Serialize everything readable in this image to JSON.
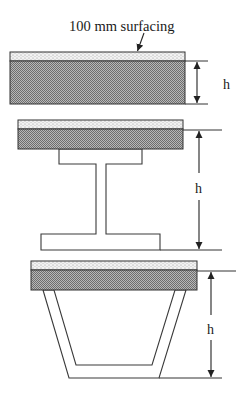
{
  "annotation": {
    "text": "100 mm surfacing",
    "arrow_from": [
      144,
      33
    ],
    "arrow_to": [
      137,
      52
    ]
  },
  "colors": {
    "line": "#333333",
    "surfacing_fill": "#f2f2f2",
    "surfacing_dot": "#9a9a9a",
    "deck_fill": "#b0b0b0",
    "deck_check": "#6e6e6e",
    "background": "#ffffff"
  },
  "sections": [
    {
      "id": "solid-slab",
      "label": "h",
      "slab": {
        "x": 10,
        "y": 52,
        "w": 175,
        "surf_h": 9,
        "deck_h": 43
      },
      "dimension": {
        "x": 197,
        "y1": 61,
        "y2": 104,
        "ext_x2": 208,
        "label_x": 227,
        "label_y": 89
      }
    },
    {
      "id": "i-girder",
      "label": "h",
      "slab": {
        "x": 18,
        "y": 120,
        "w": 165,
        "surf_h": 9,
        "deck_h": 20
      },
      "girder": {
        "top_flange": {
          "x1": 59,
          "x2": 142,
          "y1": 149,
          "y2": 164
        },
        "web": {
          "x1": 96,
          "x2": 106
        },
        "bottom_flange": {
          "x1": 41,
          "x2": 160,
          "y1": 234,
          "y2": 250
        }
      },
      "dimension": {
        "x": 199,
        "y1": 130,
        "y2": 250,
        "ext_x2": 222,
        "label_x": 199,
        "label_y": 193
      }
    },
    {
      "id": "box-girder",
      "label": "h",
      "slab": {
        "x": 31,
        "y": 261,
        "w": 166,
        "surf_h": 9,
        "deck_h": 20
      },
      "box": {
        "outer": [
          [
            43,
            290
          ],
          [
            69,
            378
          ],
          [
            159,
            378
          ],
          [
            186,
            290
          ]
        ],
        "inner": [
          [
            54,
            290
          ],
          [
            76,
            365
          ],
          [
            152,
            365
          ],
          [
            175,
            290
          ]
        ]
      },
      "dimension": {
        "x": 211,
        "y1": 271,
        "y2": 378,
        "ext_x2": 236,
        "label_x": 211,
        "label_y": 334
      }
    }
  ]
}
